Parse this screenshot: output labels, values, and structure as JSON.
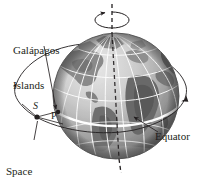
{
  "figure": {
    "background_color": "#ffffff",
    "width": 211,
    "height": 180
  },
  "labels": {
    "galapagos": "Galápagos\nIslands",
    "galapagos_line1": "Galápagos",
    "galapagos_line2": "Islands",
    "space_shuttle": "Space\nshuttle",
    "space_shuttle_line1": "Space",
    "space_shuttle_line2": "shuttle",
    "equator": "Equator",
    "point_s": "S",
    "point_p": "P"
  },
  "colors": {
    "line": "#231f20",
    "text": "#231f20",
    "grid": "#ffffff",
    "ocean_light": "#d9d9d9",
    "ocean_mid": "#b5b5b5",
    "ocean_dark": "#8a8a8a",
    "land_light": "#a8a8a8",
    "land_dark": "#6e6e6e",
    "land_darkest": "#555555",
    "shadow": "#4a4a4a"
  },
  "geometry": {
    "globe": {
      "cx": 116,
      "cy": 96,
      "r": 63
    },
    "axis": {
      "x": 112,
      "y_top": 4,
      "y_bottom": 173,
      "style": "dashed"
    },
    "north_pole": {
      "x": 112,
      "y": 33
    },
    "south_pole": {
      "x": 120,
      "y": 159
    },
    "rotation_arrow": {
      "cx": 112,
      "cy": 20,
      "rx": 17,
      "ry": 6
    },
    "orbit": {
      "cx": 100,
      "cy": 92,
      "rx": 88,
      "ry": 44,
      "rotation_deg": -12
    },
    "shuttle_point": {
      "x": 37,
      "y": 117
    },
    "surface_point_p": {
      "x": 58,
      "y": 112
    }
  },
  "elements": {
    "globe_name": "earth-globe",
    "axis_name": "rotation-axis",
    "orbit_name": "orbit-path",
    "equator_name": "equator-line"
  }
}
